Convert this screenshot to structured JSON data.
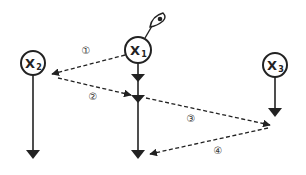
{
  "diagram": {
    "type": "flow",
    "background": "#ffffff",
    "stroke_color": "#222222",
    "nodes": [
      {
        "id": "X1",
        "letter": "X",
        "subscript": "1",
        "cx": 138,
        "cy": 50,
        "r": 13
      },
      {
        "id": "X2",
        "letter": "X",
        "subscript": "2",
        "cx": 33,
        "cy": 63,
        "r": 12
      },
      {
        "id": "X3",
        "letter": "X",
        "subscript": "3",
        "cx": 275,
        "cy": 65,
        "r": 12
      }
    ],
    "observer_icon": {
      "name": "eye-icon",
      "attached_to": "X1"
    },
    "timelines": [
      {
        "node": "X1",
        "description": "vertical solid arrow with two intermediate arrowheads"
      },
      {
        "node": "X2",
        "description": "vertical solid arrow"
      },
      {
        "node": "X3",
        "description": "vertical solid arrow (short)"
      }
    ],
    "messages": [
      {
        "step": "1",
        "label": "①",
        "from": "X1",
        "to": "X2",
        "style": "dashed"
      },
      {
        "step": "2",
        "label": "②",
        "from": "X2",
        "to": "X1",
        "style": "dashed"
      },
      {
        "step": "3",
        "label": "③",
        "from": "X1",
        "to": "X3",
        "style": "dashed"
      },
      {
        "step": "4",
        "label": "④",
        "from": "X3",
        "to": "X1",
        "style": "dashed"
      }
    ]
  }
}
